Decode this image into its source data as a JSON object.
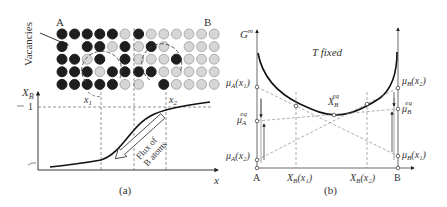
{
  "panel_a": {
    "caption": "(a)",
    "label_A": "A",
    "label_B": "B",
    "vacancies_label": "Vacancies",
    "y_axis_label": "X",
    "y_axis_sub": "B",
    "x_axis_label": "x",
    "tick_one": "1",
    "x1_label": "x",
    "x1_sub": "1",
    "x2_label": "x",
    "x2_sub": "2",
    "flux_line1": "Flux of",
    "flux_line2": "B atoms",
    "atom_grid": {
      "legend": {
        "A": "dark",
        "B": "light",
        "V": "vacancy"
      },
      "rows": [
        [
          "A",
          "A",
          "A",
          "A",
          "A",
          "B",
          "A",
          "B",
          "B",
          "B",
          "B",
          "B",
          "B"
        ],
        [
          "A",
          "V",
          "A",
          "A",
          "B",
          "A",
          "B",
          "A",
          "B",
          "V",
          "B",
          "B",
          "B"
        ],
        [
          "A",
          "A",
          "B",
          "A",
          "V",
          "A",
          "B",
          "B",
          "B",
          "A",
          "B",
          "B",
          "B"
        ],
        [
          "A",
          "A",
          "A",
          "B",
          "A",
          "A",
          "A",
          "A",
          "B",
          "B",
          "B",
          "B",
          "B"
        ],
        [
          "A",
          "A",
          "A",
          "A",
          "A",
          "B",
          "B",
          "V",
          "A",
          "B",
          "B",
          "B",
          "B"
        ]
      ]
    }
  },
  "panel_b": {
    "caption": "(b)",
    "title": "T fixed",
    "y_axis_label": "G",
    "y_axis_sup": "m",
    "mu_A_x1": "μ",
    "mu_A_x1_sub": "A",
    "mu_A_x1_arg": "(x₁)",
    "mu_A_eq": "μ",
    "mu_A_eq_sub": "A",
    "mu_A_eq_sup": "eq",
    "mu_A_x2": "μ",
    "mu_A_x2_sub": "A",
    "mu_A_x2_arg": "(x₂)",
    "mu_B_x2": "μ",
    "mu_B_x2_sub": "B",
    "mu_B_x2_arg": "(x₂)",
    "mu_B_eq": "μ",
    "mu_B_eq_sub": "B",
    "mu_B_eq_sup": "eq",
    "mu_B_x1": "μ",
    "mu_B_x1_sub": "B",
    "mu_B_x1_arg": "(x₁)",
    "XB_eq": "X",
    "XB_eq_sub": "B",
    "XB_eq_sup": "eq",
    "x_label_A": "A",
    "x_label_B": "B",
    "x_tick1": "X",
    "x_tick1_sub": "B",
    "x_tick1_arg": "(x₁)",
    "x_tick2": "X",
    "x_tick2_sub": "B",
    "x_tick2_arg": "(x₂)"
  }
}
